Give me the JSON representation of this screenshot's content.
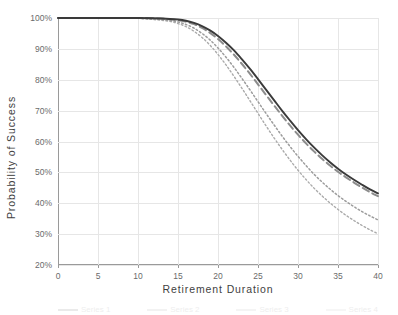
{
  "chart_data": {
    "type": "line",
    "title": "",
    "xlabel": "Retirement Duration",
    "ylabel": "Probability of Success",
    "xlim": [
      0,
      40
    ],
    "ylim": [
      20,
      100
    ],
    "grid": true,
    "legend_position": "bottom",
    "x_ticks": [
      0,
      5,
      10,
      15,
      20,
      25,
      30,
      35,
      40
    ],
    "x_tick_labels": [
      "0",
      "5",
      "10",
      "15",
      "20",
      "25",
      "30",
      "35",
      "40"
    ],
    "y_ticks": [
      20,
      30,
      40,
      50,
      60,
      70,
      80,
      90,
      100
    ],
    "y_tick_labels": [
      "20%",
      "30%",
      "40%",
      "50%",
      "60%",
      "70%",
      "80%",
      "90%",
      "100%"
    ],
    "x": [
      0,
      2,
      4,
      6,
      8,
      10,
      12,
      14,
      15,
      16,
      17,
      18,
      19,
      20,
      21,
      22,
      23,
      24,
      25,
      26,
      27,
      28,
      29,
      30,
      31,
      32,
      33,
      34,
      35,
      36,
      37,
      38,
      39,
      40
    ],
    "series": [
      {
        "name": "Series 1",
        "style": "solid",
        "color": "#3a3a3a",
        "width": 1.9,
        "values": [
          100,
          100,
          100,
          100,
          100,
          100,
          99.9,
          99.7,
          99.5,
          99.1,
          98.4,
          97.4,
          96.0,
          94.2,
          92.0,
          89.5,
          86.6,
          83.5,
          80.2,
          76.8,
          73.4,
          70.0,
          66.8,
          63.7,
          60.8,
          58.1,
          55.6,
          53.3,
          51.2,
          49.3,
          47.6,
          46.0,
          44.5,
          43.2
        ]
      },
      {
        "name": "Series 2",
        "style": "dashed",
        "color": "#8c8c8c",
        "width": 2.0,
        "values": [
          100,
          100,
          100,
          100,
          100,
          100,
          99.9,
          99.6,
          99.3,
          98.8,
          98.0,
          96.8,
          95.2,
          93.2,
          90.8,
          88.1,
          85.1,
          81.9,
          78.5,
          75.1,
          71.7,
          68.4,
          65.2,
          62.2,
          59.4,
          56.8,
          54.4,
          52.2,
          50.2,
          48.4,
          46.7,
          45.1,
          43.6,
          42.3
        ]
      },
      {
        "name": "Series 3",
        "style": "dotted",
        "color": "#9c9c9c",
        "width": 1.5,
        "values": [
          100,
          100,
          100,
          100,
          100,
          99.9,
          99.7,
          99.2,
          98.7,
          97.9,
          96.7,
          95.0,
          92.9,
          90.3,
          87.3,
          84.0,
          80.4,
          76.7,
          72.9,
          69.1,
          65.4,
          61.8,
          58.4,
          55.2,
          52.2,
          49.4,
          46.9,
          44.6,
          42.5,
          40.6,
          38.9,
          37.3,
          35.9,
          34.6
        ]
      },
      {
        "name": "Series 4",
        "style": "dotted",
        "color": "#aaaaaa",
        "width": 1.4,
        "values": [
          100,
          100,
          100,
          100,
          100,
          99.9,
          99.5,
          98.9,
          98.2,
          97.2,
          95.7,
          93.7,
          91.2,
          88.2,
          84.8,
          81.1,
          77.2,
          73.2,
          69.1,
          65.1,
          61.2,
          57.5,
          54.0,
          50.7,
          47.7,
          44.9,
          42.4,
          40.1,
          38.0,
          36.1,
          34.4,
          32.8,
          31.4,
          30.1
        ]
      }
    ],
    "legend_entries": [
      "Series 1",
      "Series 2",
      "Series 3",
      "Series 4"
    ]
  }
}
